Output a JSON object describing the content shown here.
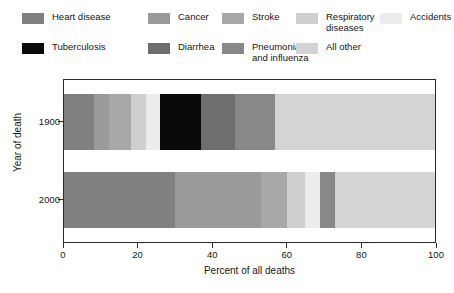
{
  "chart_data": {
    "type": "bar",
    "orientation": "horizontal",
    "stacked": true,
    "title": "",
    "xlabel": "Percent of all deaths",
    "ylabel": "Year of death",
    "xlim": [
      0,
      100
    ],
    "xticks": [
      0,
      20,
      40,
      60,
      80,
      100
    ],
    "xtick_labels": [
      "0",
      "20",
      "40",
      "60",
      "80",
      "100"
    ],
    "categories": [
      "1900",
      "2000"
    ],
    "grid": false,
    "legend_position": "above-plot",
    "series": [
      {
        "name": "Heart disease",
        "color": "#808080",
        "values": [
          8,
          30
        ]
      },
      {
        "name": "Cancer",
        "color": "#9a9a9a",
        "values": [
          4,
          23
        ]
      },
      {
        "name": "Stroke",
        "color": "#a8a8a8",
        "values": [
          6,
          7
        ]
      },
      {
        "name": "Respiratory diseases",
        "color": "#cfcfcf",
        "values": [
          4,
          5
        ]
      },
      {
        "name": "Accidents",
        "color": "#ececec",
        "values": [
          4,
          4
        ]
      },
      {
        "name": "Tuberculosis",
        "color": "#0a0a0a",
        "values": [
          11,
          0
        ]
      },
      {
        "name": "Diarrhea",
        "color": "#6e6e6e",
        "values": [
          9,
          0
        ]
      },
      {
        "name": "Pneumonia and influenza",
        "color": "#888888",
        "values": [
          11,
          4
        ]
      },
      {
        "name": "All other",
        "color": "#d4d4d4",
        "values": [
          43,
          27
        ]
      }
    ]
  },
  "legend": {
    "items": [
      {
        "label": "Heart disease",
        "color": "#808080"
      },
      {
        "label": "Cancer",
        "color": "#9a9a9a"
      },
      {
        "label": "Stroke",
        "color": "#a8a8a8"
      },
      {
        "label": "Respiratory\ndiseases",
        "color": "#cfcfcf"
      },
      {
        "label": "Accidents",
        "color": "#ececec"
      },
      {
        "label": "Tuberculosis",
        "color": "#0a0a0a"
      },
      {
        "label": "Diarrhea",
        "color": "#6e6e6e"
      },
      {
        "label": "Pneumonia\nand influenza",
        "color": "#888888"
      },
      {
        "label": "All other",
        "color": "#d4d4d4"
      }
    ]
  },
  "axes": {
    "x_title": "Percent of all deaths",
    "y_title": "Year of death",
    "x_tick_labels": [
      "0",
      "20",
      "40",
      "60",
      "80",
      "100"
    ],
    "y_tick_labels": [
      "1900",
      "2000"
    ]
  }
}
